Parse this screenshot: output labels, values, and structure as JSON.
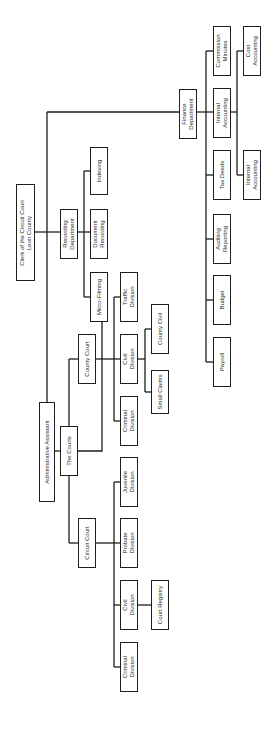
{
  "diagram": {
    "type": "org-chart",
    "orientation": "rotated-90-ccw",
    "line_color": "#1e1e1e",
    "nodes": [
      {
        "id": "clerk",
        "label": "Clerk of the Circuit Court\nLeon County",
        "x": 16,
        "y": 184,
        "w": 19,
        "h": 97
      },
      {
        "id": "recording",
        "label": "Recording\nDepartment",
        "x": 60,
        "y": 209,
        "w": 18,
        "h": 50
      },
      {
        "id": "doc-recording",
        "label": "Document\nRecording",
        "x": 90,
        "y": 209,
        "w": 18,
        "h": 50
      },
      {
        "id": "indexing",
        "label": "Indexing",
        "x": 90,
        "y": 147,
        "w": 18,
        "h": 48
      },
      {
        "id": "micro-filming",
        "label": "Micro-Filming",
        "x": 90,
        "y": 272,
        "w": 18,
        "h": 50
      },
      {
        "id": "admin",
        "label": "Administrative Assistant",
        "x": 39,
        "y": 402,
        "w": 16,
        "h": 100
      },
      {
        "id": "courts",
        "label": "The Courts",
        "x": 60,
        "y": 426,
        "w": 18,
        "h": 50
      },
      {
        "id": "county-court",
        "label": "County Court",
        "x": 78,
        "y": 334,
        "w": 18,
        "h": 50
      },
      {
        "id": "traffic",
        "label": "Traffic\nDivision",
        "x": 120,
        "y": 272,
        "w": 18,
        "h": 50
      },
      {
        "id": "county-civil-div",
        "label": "Civil\nDivision",
        "x": 120,
        "y": 334,
        "w": 18,
        "h": 50
      },
      {
        "id": "county-criminal",
        "label": "Criminal\nDivision",
        "x": 120,
        "y": 396,
        "w": 18,
        "h": 50
      },
      {
        "id": "county-civil",
        "label": "County Civil",
        "x": 151,
        "y": 304,
        "w": 18,
        "h": 50
      },
      {
        "id": "small-claims",
        "label": "Small Claims",
        "x": 151,
        "y": 370,
        "w": 18,
        "h": 44
      },
      {
        "id": "juvenile",
        "label": "Juvenile\nDivision",
        "x": 120,
        "y": 457,
        "w": 18,
        "h": 50
      },
      {
        "id": "circuit-court",
        "label": "Circuit Court",
        "x": 78,
        "y": 518,
        "w": 18,
        "h": 50
      },
      {
        "id": "probate",
        "label": "Probate\nDivision",
        "x": 120,
        "y": 518,
        "w": 18,
        "h": 50
      },
      {
        "id": "circuit-civil",
        "label": "Civil\nDivision",
        "x": 120,
        "y": 580,
        "w": 18,
        "h": 50
      },
      {
        "id": "court-registry",
        "label": "Court Registry",
        "x": 151,
        "y": 580,
        "w": 18,
        "h": 50
      },
      {
        "id": "circuit-criminal",
        "label": "Criminal\nDivision",
        "x": 120,
        "y": 642,
        "w": 18,
        "h": 50
      },
      {
        "id": "finance",
        "label": "Finance\nDepartment",
        "x": 179,
        "y": 89,
        "w": 18,
        "h": 50
      },
      {
        "id": "commission-minutes",
        "label": "Commission\nMinutes",
        "x": 213,
        "y": 26,
        "w": 18,
        "h": 50
      },
      {
        "id": "internal-accounting",
        "label": "Internal\nAccounting",
        "x": 213,
        "y": 88,
        "w": 18,
        "h": 50
      },
      {
        "id": "cost-accounting",
        "label": "Cost\nAccounting",
        "x": 243,
        "y": 26,
        "w": 18,
        "h": 50
      },
      {
        "id": "tax-deeds",
        "label": "Tax Deeds",
        "x": 213,
        "y": 150,
        "w": 18,
        "h": 50
      },
      {
        "id": "internal-accounting-2",
        "label": "Internal\nAccounting",
        "x": 243,
        "y": 150,
        "w": 18,
        "h": 50
      },
      {
        "id": "auditing-reporting",
        "label": "Auditing\nReporting",
        "x": 213,
        "y": 214,
        "w": 18,
        "h": 50
      },
      {
        "id": "budget",
        "label": "Budget",
        "x": 213,
        "y": 275,
        "w": 18,
        "h": 50
      },
      {
        "id": "payroll",
        "label": "Payroll",
        "x": 213,
        "y": 337,
        "w": 18,
        "h": 50
      }
    ],
    "edges": [
      [
        "clerk",
        "admin"
      ],
      [
        "clerk",
        "finance"
      ],
      [
        "clerk",
        "recording"
      ],
      [
        "recording",
        "doc-recording"
      ],
      [
        "recording",
        "indexing"
      ],
      [
        "recording",
        "micro-filming"
      ],
      [
        "admin",
        "courts"
      ],
      [
        "courts",
        "county-court"
      ],
      [
        "courts",
        "circuit-court"
      ],
      [
        "county-court",
        "traffic"
      ],
      [
        "county-court",
        "county-civil-div"
      ],
      [
        "county-court",
        "county-criminal"
      ],
      [
        "county-civil-div",
        "county-civil"
      ],
      [
        "county-civil-div",
        "small-claims"
      ],
      [
        "circuit-court",
        "juvenile"
      ],
      [
        "circuit-court",
        "probate"
      ],
      [
        "circuit-court",
        "circuit-civil"
      ],
      [
        "circuit-court",
        "circuit-criminal"
      ],
      [
        "circuit-civil",
        "court-registry"
      ],
      [
        "finance",
        "commission-minutes"
      ],
      [
        "finance",
        "internal-accounting"
      ],
      [
        "finance",
        "tax-deeds"
      ],
      [
        "finance",
        "auditing-reporting"
      ],
      [
        "finance",
        "budget"
      ],
      [
        "finance",
        "payroll"
      ],
      [
        "internal-accounting",
        "cost-accounting"
      ],
      [
        "internal-accounting",
        "internal-accounting-2"
      ]
    ]
  }
}
